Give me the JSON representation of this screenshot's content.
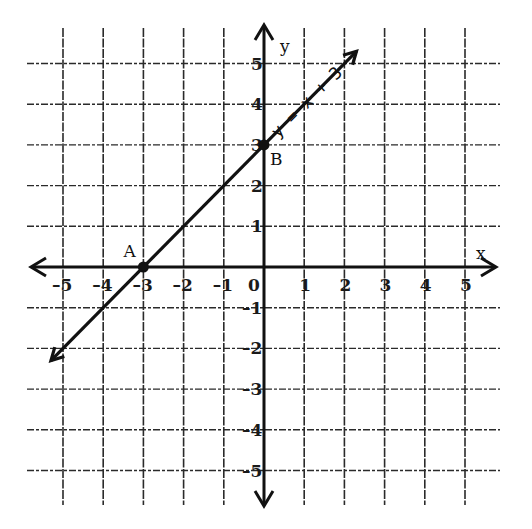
{
  "chart_data": {
    "type": "line",
    "title": "",
    "xlabel": "x",
    "ylabel": "y",
    "xlim": [
      -5,
      5
    ],
    "ylim": [
      -5,
      5
    ],
    "grid": true,
    "x_ticks": [
      "-5",
      "-4",
      "-3",
      "-2",
      "-1",
      "0",
      "1",
      "2",
      "3",
      "4",
      "5"
    ],
    "y_ticks": [
      "5",
      "4",
      "3",
      "2",
      "1",
      "-1",
      "-2",
      "-3",
      "-4",
      "-5"
    ],
    "series": [
      {
        "name": "y = x + 3",
        "equation": "y = x + 3",
        "slope": 1,
        "intercept": 3,
        "x": [
          -5.3,
          2.3
        ],
        "y": [
          -2.3,
          5.3
        ]
      }
    ],
    "points": [
      {
        "label": "A",
        "x": -3,
        "y": 0
      },
      {
        "label": "B",
        "x": 0,
        "y": 3
      }
    ],
    "annotations": [
      "y = x + 3",
      "A",
      "B"
    ]
  },
  "labels": {
    "x_axis": "x",
    "y_axis": "y",
    "point_a": "A",
    "point_b": "B",
    "equation": "y = x + 3"
  }
}
